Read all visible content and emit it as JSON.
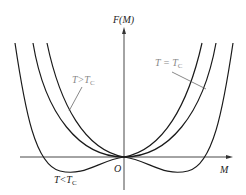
{
  "diagram": {
    "y_axis_label": "F(M)",
    "x_axis_label": "M",
    "origin_label": "O",
    "curves": [
      {
        "name": "T>Tc",
        "label_main": "T>T",
        "label_sub": "C"
      },
      {
        "name": "T=Tc",
        "label_main": "T = T",
        "label_sub": "C"
      },
      {
        "name": "T<Tc",
        "label_main": "T<T",
        "label_sub": "C"
      }
    ],
    "colors": {
      "curve": "#1a1a1a",
      "axis": "#333333",
      "leader": "#555555"
    }
  }
}
